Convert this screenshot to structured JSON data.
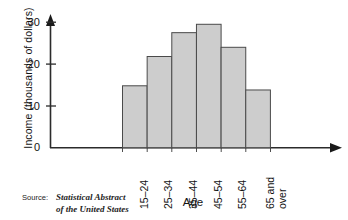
{
  "chart_data": {
    "type": "bar",
    "title": "",
    "categories": [
      "15–24",
      "25–34",
      "35–44",
      "45–54",
      "55–64",
      "65 and over"
    ],
    "values": [
      14.8,
      21.8,
      27.5,
      29.5,
      24.0,
      13.8
    ],
    "xlabel": "Age",
    "ylabel": "Income (thousands of dollars)",
    "ylim": [
      0,
      32
    ],
    "yticks": [
      0,
      10,
      20,
      30
    ],
    "ytick_labels": [
      "0",
      "10",
      "20",
      "30"
    ],
    "grid": false,
    "legend": false,
    "bar_fill_color": "#cdcdcd",
    "bar_edge_color": "#4a4a4a",
    "axis_color": "#2b2b2b"
  },
  "category_label_lines": [
    [
      "15–24"
    ],
    [
      "25–34"
    ],
    [
      "35–44"
    ],
    [
      "45–54"
    ],
    [
      "55–64"
    ],
    [
      "65 and",
      "over"
    ]
  ],
  "source": {
    "label": "Source:",
    "line1": "Statistical Abstract",
    "line2": "of the United States"
  }
}
